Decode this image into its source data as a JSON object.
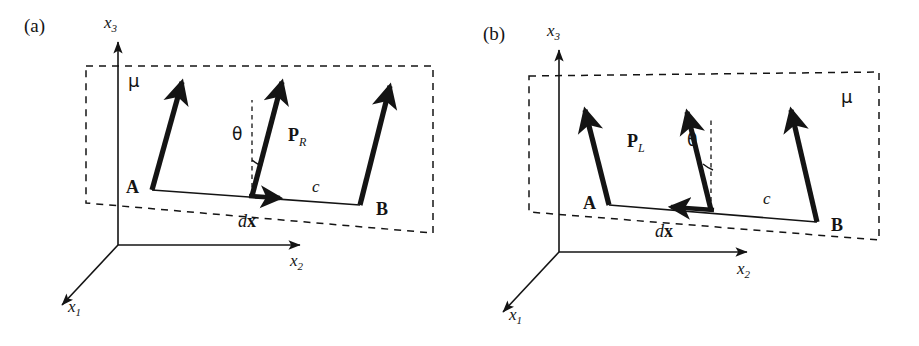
{
  "figure": {
    "background": "#ffffff",
    "ink": "#141414",
    "width": 919,
    "height": 346
  },
  "panels": [
    {
      "id": "a",
      "tag": "(a)",
      "surface_label": "μ",
      "surface_label_position": "top-left",
      "point_a": "A",
      "point_b": "B",
      "separation_label": "c",
      "displacement_label_italic": "d",
      "displacement_label_bold": "x",
      "angle_label": "θ",
      "polarization_symbol": "P",
      "polarization_subscript": "R",
      "polarization_side": "right",
      "theta_side": "left",
      "vector_tilt_direction": "right",
      "center_arrow_direction": "right",
      "axes": [
        {
          "name": "x1",
          "label": "x",
          "sub": "1",
          "direction": "down-left"
        },
        {
          "name": "x2",
          "label": "x",
          "sub": "2",
          "direction": "right"
        },
        {
          "name": "x3",
          "label": "x",
          "sub": "3",
          "direction": "up"
        }
      ]
    },
    {
      "id": "b",
      "tag": "(b)",
      "surface_label": "μ",
      "surface_label_position": "top-right",
      "point_a": "A",
      "point_b": "B",
      "separation_label": "c",
      "displacement_label_italic": "d",
      "displacement_label_bold": "x",
      "angle_label": "θ",
      "polarization_symbol": "P",
      "polarization_subscript": "L",
      "polarization_side": "left",
      "theta_side": "right",
      "vector_tilt_direction": "left",
      "center_arrow_direction": "left",
      "axes": [
        {
          "name": "x1",
          "label": "x",
          "sub": "1",
          "direction": "down-left"
        },
        {
          "name": "x2",
          "label": "x",
          "sub": "2",
          "direction": "right"
        },
        {
          "name": "x3",
          "label": "x",
          "sub": "3",
          "direction": "up"
        }
      ]
    }
  ]
}
